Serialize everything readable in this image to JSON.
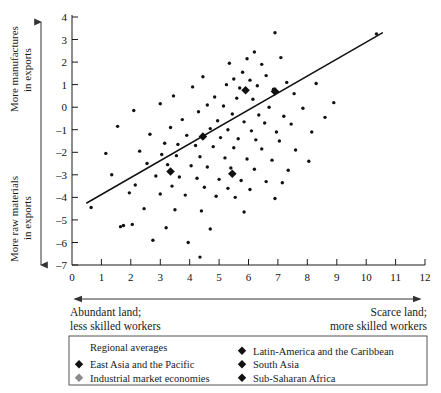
{
  "chart_data": {
    "type": "scatter",
    "title": "",
    "xlabel": "",
    "ylabel": "",
    "xlim": [
      0,
      12
    ],
    "ylim": [
      -7,
      4
    ],
    "grid": false,
    "legend_position": "bottom",
    "x_ticks": [
      "0",
      "1",
      "2",
      "3",
      "4",
      "5",
      "6",
      "7",
      "8",
      "9",
      "10",
      "11",
      "12"
    ],
    "y_ticks": [
      "4",
      "3",
      "2",
      "1",
      "0",
      "-1",
      "-2",
      "-3",
      "-4",
      "-5",
      "-6",
      "-7"
    ],
    "y_axis_top_label": "More manufactures\nin exports",
    "y_axis_bottom_label": "More raw materials\nin exports",
    "x_axis_left_note_line1": "Abundant land;",
    "x_axis_left_note_line2": "less skilled workers",
    "x_axis_right_note_line1": "Scarce land;",
    "x_axis_right_note_line2": "more skilled workers",
    "trendline": {
      "name": "fitted regression line",
      "x_start": 0.5,
      "y_start": -4.25,
      "x_end": 10.55,
      "y_end": 3.3
    },
    "series": [
      {
        "name": "countries",
        "marker": "circle",
        "color": "#111111",
        "points": [
          [
            10.35,
            3.25
          ],
          [
            6.9,
            3.3
          ],
          [
            6.2,
            2.45
          ],
          [
            7.1,
            2.2
          ],
          [
            5.95,
            2.15
          ],
          [
            5.35,
            1.95
          ],
          [
            6.45,
            1.9
          ],
          [
            5.8,
            1.55
          ],
          [
            6.6,
            1.4
          ],
          [
            4.45,
            1.35
          ],
          [
            5.5,
            1.25
          ],
          [
            6.05,
            1.2
          ],
          [
            7.3,
            1.1
          ],
          [
            8.3,
            1.05
          ],
          [
            5.25,
            1.0
          ],
          [
            6.3,
            0.95
          ],
          [
            4.1,
            0.9
          ],
          [
            5.7,
            0.85
          ],
          [
            6.85,
            0.8
          ],
          [
            7.55,
            0.6
          ],
          [
            3.45,
            0.5
          ],
          [
            4.85,
            0.45
          ],
          [
            5.6,
            0.4
          ],
          [
            6.15,
            0.35
          ],
          [
            8.9,
            0.2
          ],
          [
            3.0,
            0.15
          ],
          [
            4.6,
            0.1
          ],
          [
            5.15,
            0.05
          ],
          [
            6.7,
            0.0
          ],
          [
            7.85,
            -0.05
          ],
          [
            2.1,
            -0.15
          ],
          [
            4.3,
            -0.2
          ],
          [
            5.45,
            -0.3
          ],
          [
            6.35,
            -0.35
          ],
          [
            7.2,
            -0.4
          ],
          [
            8.6,
            -0.45
          ],
          [
            3.75,
            -0.55
          ],
          [
            4.95,
            -0.6
          ],
          [
            5.85,
            -0.65
          ],
          [
            6.55,
            -0.7
          ],
          [
            7.45,
            -0.75
          ],
          [
            1.55,
            -0.85
          ],
          [
            3.35,
            -0.9
          ],
          [
            4.7,
            -0.95
          ],
          [
            5.3,
            -1.0
          ],
          [
            6.1,
            -1.05
          ],
          [
            6.95,
            -1.1
          ],
          [
            8.15,
            -1.1
          ],
          [
            2.65,
            -1.2
          ],
          [
            3.9,
            -1.25
          ],
          [
            4.45,
            -1.3
          ],
          [
            5.05,
            -1.35
          ],
          [
            5.65,
            -1.4
          ],
          [
            6.25,
            -1.45
          ],
          [
            7.05,
            -1.5
          ],
          [
            3.15,
            -1.6
          ],
          [
            3.6,
            -1.65
          ],
          [
            4.2,
            -1.7
          ],
          [
            4.8,
            -1.75
          ],
          [
            5.5,
            -1.8
          ],
          [
            6.45,
            -1.85
          ],
          [
            7.6,
            -1.9
          ],
          [
            2.3,
            -1.95
          ],
          [
            1.15,
            -2.05
          ],
          [
            3.05,
            -2.1
          ],
          [
            3.55,
            -2.15
          ],
          [
            4.35,
            -2.2
          ],
          [
            5.2,
            -2.25
          ],
          [
            5.95,
            -2.3
          ],
          [
            6.8,
            -2.35
          ],
          [
            8.05,
            -2.4
          ],
          [
            2.55,
            -2.5
          ],
          [
            3.25,
            -2.55
          ],
          [
            4.05,
            -2.6
          ],
          [
            4.6,
            -2.65
          ],
          [
            5.4,
            -2.7
          ],
          [
            6.2,
            -2.75
          ],
          [
            7.35,
            -2.8
          ],
          [
            1.35,
            -3.0
          ],
          [
            2.85,
            -3.05
          ],
          [
            3.65,
            -3.1
          ],
          [
            4.25,
            -3.15
          ],
          [
            5.0,
            -3.2
          ],
          [
            5.75,
            -3.25
          ],
          [
            6.6,
            -3.3
          ],
          [
            7.15,
            -3.35
          ],
          [
            2.15,
            -3.45
          ],
          [
            3.4,
            -3.5
          ],
          [
            4.5,
            -3.55
          ],
          [
            5.3,
            -3.6
          ],
          [
            6.05,
            -3.65
          ],
          [
            1.95,
            -3.8
          ],
          [
            3.0,
            -3.85
          ],
          [
            3.85,
            -3.9
          ],
          [
            4.9,
            -3.95
          ],
          [
            5.55,
            -4.0
          ],
          [
            6.9,
            -4.05
          ],
          [
            0.65,
            -4.45
          ],
          [
            2.45,
            -4.5
          ],
          [
            3.5,
            -4.55
          ],
          [
            4.4,
            -4.6
          ],
          [
            5.85,
            -4.65
          ],
          [
            1.75,
            -5.25
          ],
          [
            2.05,
            -5.2
          ],
          [
            1.65,
            -5.3
          ],
          [
            3.2,
            -5.35
          ],
          [
            4.7,
            -5.4
          ],
          [
            2.75,
            -5.9
          ],
          [
            3.95,
            -6.0
          ],
          [
            4.35,
            -6.65
          ]
        ]
      },
      {
        "name": "East Asia and the Pacific",
        "marker": "diamond",
        "color": "#111111",
        "points": [
          [
            5.9,
            0.75
          ]
        ]
      },
      {
        "name": "Latin-America and the Caribbean",
        "marker": "diamond",
        "color": "#111111",
        "points": [
          [
            4.45,
            -1.3
          ]
        ]
      },
      {
        "name": "South Asia",
        "marker": "diamond",
        "color": "#111111",
        "points": [
          [
            3.35,
            -2.85
          ]
        ]
      },
      {
        "name": "Sub-Saharan Africa",
        "marker": "diamond",
        "color": "#111111",
        "points": [
          [
            5.45,
            -2.95
          ]
        ]
      },
      {
        "name": "Industrial market economies",
        "marker": "diamond",
        "color": "#808080",
        "points": [
          [
            6.9,
            0.7
          ]
        ]
      }
    ]
  },
  "legend": {
    "title": "Regional averages",
    "left_column": [
      {
        "label": "East Asia and the Pacific",
        "color": "#111111",
        "marker": "diamond"
      },
      {
        "label": "Industrial market economies",
        "color": "#8a8a8a",
        "marker": "diamond"
      }
    ],
    "right_column": [
      {
        "label": "Latin-America and the Caribbean",
        "color": "#111111",
        "marker": "diamond"
      },
      {
        "label": "South Asia",
        "color": "#111111",
        "marker": "diamond"
      },
      {
        "label": "Sub-Saharan Africa",
        "color": "#111111",
        "marker": "diamond"
      }
    ]
  }
}
